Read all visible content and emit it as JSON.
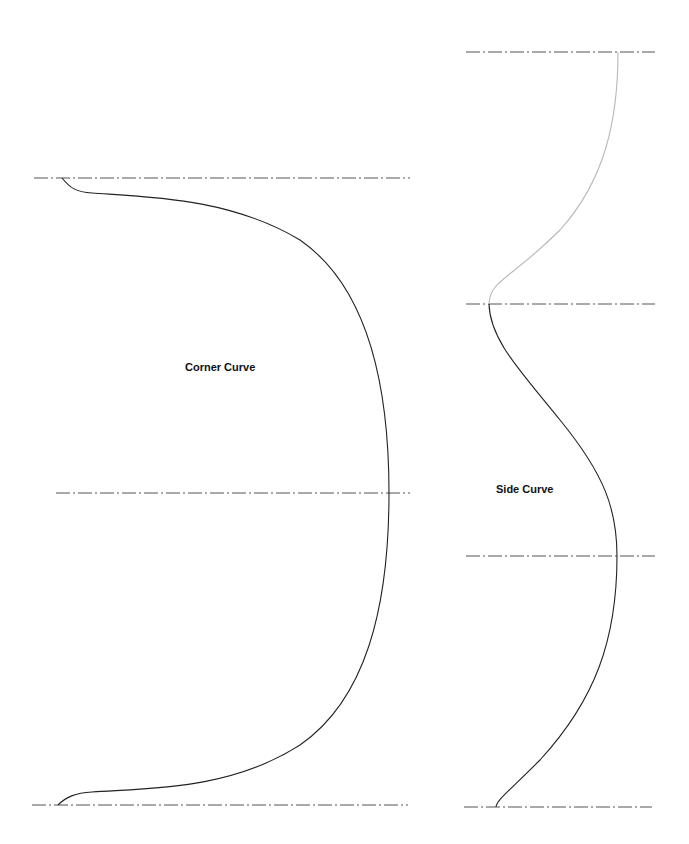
{
  "colors": {
    "background": "#ffffff",
    "curve": "#222222",
    "curve_faded": "#b8b8b8",
    "center_line": "#555555",
    "label": "#111111"
  },
  "diagram": {
    "panels": [
      {
        "id": "corner",
        "label": "Corner Curve",
        "label_pos": {
          "x": 185,
          "y": 361
        },
        "center_lines": [
          {
            "y": 178,
            "x1": 34,
            "x2": 410
          },
          {
            "y": 493,
            "x1": 56,
            "x2": 410
          },
          {
            "y": 805,
            "x1": 32,
            "x2": 408
          }
        ]
      },
      {
        "id": "side",
        "label": "Side Curve",
        "label_pos": {
          "x": 496,
          "y": 483
        },
        "center_lines": [
          {
            "y": 52,
            "x1": 466,
            "x2": 655
          },
          {
            "y": 304,
            "x1": 466,
            "x2": 655
          },
          {
            "y": 556,
            "x1": 466,
            "x2": 655
          },
          {
            "y": 807,
            "x1": 464,
            "x2": 652
          }
        ]
      }
    ]
  }
}
